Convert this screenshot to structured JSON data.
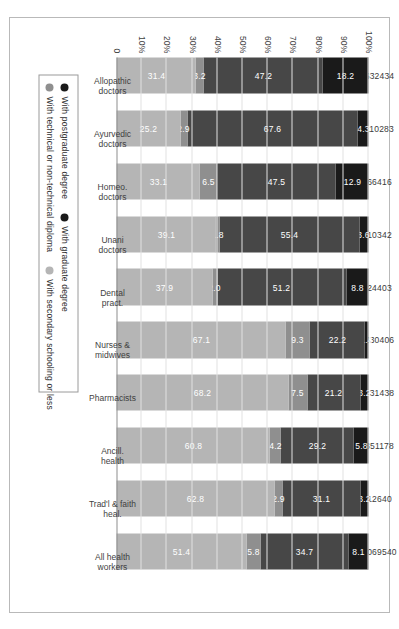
{
  "chart_data": {
    "type": "bar",
    "subtype": "stacked-column-100pct",
    "title": "",
    "xlabel": "",
    "ylabel": "",
    "ylim": [
      0,
      100
    ],
    "ytick_labels": [
      "100%",
      "90%",
      "80%",
      "70%",
      "60%",
      "50%",
      "40%",
      "30%",
      "20%",
      "10%",
      "0"
    ],
    "ytick_values": [
      100,
      90,
      80,
      70,
      60,
      50,
      40,
      30,
      20,
      10,
      0
    ],
    "grid": true,
    "legend_position": "bottom",
    "categories": [
      "Allopathic doctors",
      "Ayurvedic doctors",
      "Homeo. doctors",
      "Unani doctors",
      "Dental pract.",
      "Nurses & midwives",
      "Pharmacists",
      "Ancill. health",
      "Trad'l & faith heal.",
      "All health workers"
    ],
    "category_lines": [
      [
        "Allopathic",
        "doctors"
      ],
      [
        "Ayurvedic",
        "doctors"
      ],
      [
        "Homeo.",
        "doctors"
      ],
      [
        "Unani",
        "doctors"
      ],
      [
        "Dental",
        "pract."
      ],
      [
        "Nurses &",
        "midwives"
      ],
      [
        "Pharmacists",
        ""
      ],
      [
        "Ancill.",
        "health"
      ],
      [
        "Trad'l & faith",
        "heal."
      ],
      [
        "All health",
        "workers"
      ]
    ],
    "totals": [
      "632434",
      "110283",
      "66416",
      "10342",
      "24403",
      "630406",
      "231438",
      "351178",
      "12640",
      "2069540"
    ],
    "series": [
      {
        "name": "With postgraduate degree",
        "color": "#1a1a1a",
        "values": [
          18.2,
          4.3,
          12.9,
          3.6,
          8.8,
          1.4,
          3.2,
          5.8,
          3.2,
          8.1
        ],
        "labels": [
          "18.2",
          "4.3",
          "12.9",
          "3.6",
          "8.8",
          "1.4",
          "3.2",
          "5.8",
          "3.2",
          "8.1"
        ]
      },
      {
        "name": "With graduate degree",
        "color": "#474747",
        "values": [
          47.2,
          67.6,
          47.5,
          55.4,
          51.2,
          22.2,
          21.2,
          29.2,
          31.1,
          34.7
        ],
        "labels": [
          "47.2",
          "67.6",
          "47.5",
          "55.4",
          "51.2",
          "22.2",
          "21.2",
          "29.2",
          "31.1",
          "34.7"
        ]
      },
      {
        "name": "With technical or non-technical diploma",
        "color": "#8f8f8f",
        "values": [
          3.2,
          2.9,
          6.5,
          1.8,
          2.0,
          9.3,
          7.5,
          4.2,
          2.9,
          5.8
        ],
        "labels": [
          "3.2",
          "2.9",
          "6.5",
          "1.8",
          "2.0",
          "9.3",
          "7.5",
          "4.2",
          "2.9",
          "5.8"
        ]
      },
      {
        "name": "With secondary schooling or less",
        "color": "#b5b5b5",
        "values": [
          31.4,
          25.2,
          33.1,
          39.1,
          37.9,
          67.1,
          68.2,
          60.8,
          62.8,
          51.4
        ],
        "labels": [
          "31.4",
          "25.2",
          "33.1",
          "39.1",
          "37.9",
          "67.1",
          "68.2",
          "60.8",
          "62.8",
          "51.4"
        ]
      }
    ],
    "legend": [
      {
        "label": "With postgraduate degree",
        "color": "#1a1a1a"
      },
      {
        "label": "With graduate degree",
        "color": "#1a1a1a"
      },
      {
        "label": "With technical or non-technical diploma",
        "color": "#8f8f8f"
      },
      {
        "label": "With secondary schooling or less",
        "color": "#b5b5b5"
      }
    ]
  }
}
